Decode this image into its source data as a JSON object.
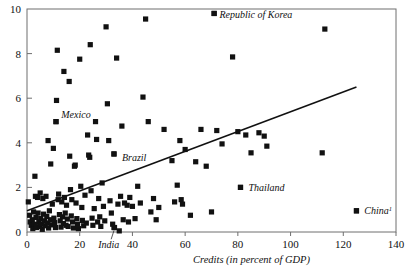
{
  "chart_data": {
    "type": "scatter",
    "title": "",
    "xlabel": "Credits (in percent of GDP)",
    "ylabel": "",
    "xlim": [
      0,
      140
    ],
    "ylim": [
      0,
      10
    ],
    "xticks": [
      0,
      20,
      40,
      60,
      80,
      100,
      120,
      140
    ],
    "xtick_labels": [
      "0",
      "20",
      "40",
      "60",
      "80",
      "100",
      "120",
      "140"
    ],
    "yticks": [
      0,
      2,
      4,
      6,
      8,
      10
    ],
    "ytick_labels": [
      "0",
      "2",
      "4",
      "6",
      "8",
      "10"
    ],
    "grid": false,
    "legend": false,
    "marker": "filled-square",
    "marker_color": "#111111",
    "frame_color": "#6f6f6f",
    "trendline": {
      "type": "linear-fit",
      "color": "#111111",
      "x_start": 0,
      "y_start": 0.95,
      "x_end": 125,
      "y_end": 6.5
    },
    "annotations": [
      {
        "text": "Republic of Korea",
        "x": 73,
        "y": 9.75,
        "style": "italic",
        "marker_at": [
          71,
          9.8
        ]
      },
      {
        "text": "Mexico",
        "x": 13,
        "y": 5.25,
        "style": "italic",
        "marker_at": [
          11,
          4.95
        ]
      },
      {
        "text": "Brazil",
        "x": 36,
        "y": 3.35,
        "style": "italic",
        "marker_at": [
          33,
          3.5
        ]
      },
      {
        "text": "Thailand",
        "x": 84,
        "y": 2.0,
        "style": "italic",
        "marker_at": [
          81,
          2.0
        ]
      },
      {
        "text": "China",
        "x": 128,
        "y": 0.95,
        "superscript": "1",
        "style": "italic",
        "marker_at": [
          125,
          0.95
        ]
      },
      {
        "text": "India",
        "x": 27,
        "y": -0.55,
        "style": "italic",
        "marker_at": [
          33,
          0.2
        ],
        "leader_line": true
      }
    ],
    "points": [
      {
        "x": 0.5,
        "y": 1.35
      },
      {
        "x": 1.0,
        "y": 0.75
      },
      {
        "x": 1.2,
        "y": 0.45
      },
      {
        "x": 1.6,
        "y": 0.3
      },
      {
        "x": 2.0,
        "y": 0.55
      },
      {
        "x": 2.2,
        "y": 0.15
      },
      {
        "x": 2.5,
        "y": 0.9
      },
      {
        "x": 2.8,
        "y": 0.35
      },
      {
        "x": 3.0,
        "y": 2.5
      },
      {
        "x": 3.2,
        "y": 1.6
      },
      {
        "x": 3.4,
        "y": 0.65
      },
      {
        "x": 3.6,
        "y": 0.2
      },
      {
        "x": 4.0,
        "y": 1.55
      },
      {
        "x": 4.2,
        "y": 0.85
      },
      {
        "x": 4.5,
        "y": 0.45
      },
      {
        "x": 4.8,
        "y": 0.25
      },
      {
        "x": 5.0,
        "y": 1.75
      },
      {
        "x": 5.2,
        "y": 0.6
      },
      {
        "x": 5.5,
        "y": 0.35
      },
      {
        "x": 5.8,
        "y": 0.12
      },
      {
        "x": 6.0,
        "y": 1.5
      },
      {
        "x": 6.3,
        "y": 0.8
      },
      {
        "x": 6.6,
        "y": 0.5
      },
      {
        "x": 6.9,
        "y": 0.28
      },
      {
        "x": 7.2,
        "y": 1.6
      },
      {
        "x": 7.5,
        "y": 0.7
      },
      {
        "x": 7.8,
        "y": 0.4
      },
      {
        "x": 8.0,
        "y": 4.1
      },
      {
        "x": 8.2,
        "y": 0.18
      },
      {
        "x": 8.5,
        "y": 0.95
      },
      {
        "x": 8.8,
        "y": 0.55
      },
      {
        "x": 9.0,
        "y": 3.05
      },
      {
        "x": 9.3,
        "y": 0.32
      },
      {
        "x": 9.6,
        "y": 1.25
      },
      {
        "x": 10.0,
        "y": 3.75
      },
      {
        "x": 10.2,
        "y": 0.62
      },
      {
        "x": 10.5,
        "y": 0.42
      },
      {
        "x": 10.8,
        "y": 0.2
      },
      {
        "x": 11.0,
        "y": 4.95
      },
      {
        "x": 11.2,
        "y": 5.9
      },
      {
        "x": 11.5,
        "y": 8.15
      },
      {
        "x": 11.8,
        "y": 1.45
      },
      {
        "x": 12.0,
        "y": 1.7
      },
      {
        "x": 12.3,
        "y": 0.78
      },
      {
        "x": 12.6,
        "y": 0.5
      },
      {
        "x": 12.9,
        "y": 0.22
      },
      {
        "x": 13.2,
        "y": 1.35
      },
      {
        "x": 13.5,
        "y": 0.68
      },
      {
        "x": 13.8,
        "y": 0.38
      },
      {
        "x": 14.0,
        "y": 7.2
      },
      {
        "x": 14.2,
        "y": 1.55
      },
      {
        "x": 14.5,
        "y": 0.85
      },
      {
        "x": 14.8,
        "y": 0.3
      },
      {
        "x": 15.0,
        "y": 1.2
      },
      {
        "x": 15.3,
        "y": 0.58
      },
      {
        "x": 15.6,
        "y": 0.25
      },
      {
        "x": 16.0,
        "y": 6.75
      },
      {
        "x": 16.2,
        "y": 3.4
      },
      {
        "x": 16.5,
        "y": 1.9
      },
      {
        "x": 16.8,
        "y": 0.72
      },
      {
        "x": 17.0,
        "y": 1.45
      },
      {
        "x": 17.3,
        "y": 0.45
      },
      {
        "x": 17.6,
        "y": 0.18
      },
      {
        "x": 18.0,
        "y": 2.95
      },
      {
        "x": 18.3,
        "y": 3.0
      },
      {
        "x": 18.6,
        "y": 1.3
      },
      {
        "x": 18.9,
        "y": 0.6
      },
      {
        "x": 19.2,
        "y": 0.35
      },
      {
        "x": 19.5,
        "y": 0.15
      },
      {
        "x": 20.0,
        "y": 7.75
      },
      {
        "x": 20.4,
        "y": 2.05
      },
      {
        "x": 20.8,
        "y": 1.1
      },
      {
        "x": 21.0,
        "y": 0.52
      },
      {
        "x": 21.5,
        "y": 0.28
      },
      {
        "x": 22.0,
        "y": 1.65
      },
      {
        "x": 22.5,
        "y": 0.4
      },
      {
        "x": 23.0,
        "y": 4.35
      },
      {
        "x": 23.4,
        "y": 3.45
      },
      {
        "x": 23.8,
        "y": 3.35
      },
      {
        "x": 24.0,
        "y": 8.4
      },
      {
        "x": 24.3,
        "y": 1.85
      },
      {
        "x": 24.7,
        "y": 0.62
      },
      {
        "x": 25.0,
        "y": 0.3
      },
      {
        "x": 25.5,
        "y": 1.05
      },
      {
        "x": 26.0,
        "y": 4.95
      },
      {
        "x": 26.4,
        "y": 4.15
      },
      {
        "x": 26.8,
        "y": 0.45
      },
      {
        "x": 27.2,
        "y": 1.5
      },
      {
        "x": 27.6,
        "y": 0.68
      },
      {
        "x": 28.0,
        "y": 0.25
      },
      {
        "x": 28.5,
        "y": 2.2
      },
      {
        "x": 29.0,
        "y": 1.15
      },
      {
        "x": 29.5,
        "y": 0.5
      },
      {
        "x": 30.0,
        "y": 9.2
      },
      {
        "x": 30.5,
        "y": 5.75
      },
      {
        "x": 31.0,
        "y": 4.1
      },
      {
        "x": 31.5,
        "y": 1.4
      },
      {
        "x": 32.0,
        "y": 0.85
      },
      {
        "x": 32.5,
        "y": 0.35
      },
      {
        "x": 33.0,
        "y": 3.5
      },
      {
        "x": 33.2,
        "y": 0.2
      },
      {
        "x": 34.0,
        "y": 7.8
      },
      {
        "x": 34.5,
        "y": 1.25
      },
      {
        "x": 35.0,
        "y": 0.05
      },
      {
        "x": 35.5,
        "y": 1.6
      },
      {
        "x": 36.0,
        "y": 4.75
      },
      {
        "x": 36.5,
        "y": 0.55
      },
      {
        "x": 37.0,
        "y": 1.3
      },
      {
        "x": 38.0,
        "y": 1.2
      },
      {
        "x": 38.5,
        "y": 0.45
      },
      {
        "x": 39.0,
        "y": 1.55
      },
      {
        "x": 40.0,
        "y": 1.15
      },
      {
        "x": 41.0,
        "y": 0.6
      },
      {
        "x": 42.0,
        "y": 2.05
      },
      {
        "x": 43.0,
        "y": 1.3
      },
      {
        "x": 44.0,
        "y": 6.05
      },
      {
        "x": 45.0,
        "y": 9.55
      },
      {
        "x": 46.0,
        "y": 4.95
      },
      {
        "x": 47.0,
        "y": 0.9
      },
      {
        "x": 48.0,
        "y": 1.5
      },
      {
        "x": 49.0,
        "y": 0.55
      },
      {
        "x": 50.0,
        "y": 1.1
      },
      {
        "x": 52.0,
        "y": 4.6
      },
      {
        "x": 55.0,
        "y": 3.2
      },
      {
        "x": 56.0,
        "y": 1.35
      },
      {
        "x": 57.0,
        "y": 2.1
      },
      {
        "x": 58.0,
        "y": 4.1
      },
      {
        "x": 58.5,
        "y": 1.45
      },
      {
        "x": 59.0,
        "y": 1.25
      },
      {
        "x": 60.0,
        "y": 3.7
      },
      {
        "x": 62.0,
        "y": 0.75
      },
      {
        "x": 64.0,
        "y": 3.15
      },
      {
        "x": 66.0,
        "y": 4.6
      },
      {
        "x": 68.0,
        "y": 2.95
      },
      {
        "x": 70.0,
        "y": 0.9
      },
      {
        "x": 71.0,
        "y": 9.8
      },
      {
        "x": 72.0,
        "y": 4.55
      },
      {
        "x": 74.0,
        "y": 3.95
      },
      {
        "x": 78.0,
        "y": 7.85
      },
      {
        "x": 80.0,
        "y": 4.5
      },
      {
        "x": 81.0,
        "y": 2.0
      },
      {
        "x": 83.0,
        "y": 4.35
      },
      {
        "x": 85.0,
        "y": 3.55
      },
      {
        "x": 88.0,
        "y": 4.45
      },
      {
        "x": 90.0,
        "y": 4.3
      },
      {
        "x": 91.0,
        "y": 3.85
      },
      {
        "x": 112.0,
        "y": 3.55
      },
      {
        "x": 113.0,
        "y": 9.1
      },
      {
        "x": 125.0,
        "y": 0.95
      }
    ]
  }
}
